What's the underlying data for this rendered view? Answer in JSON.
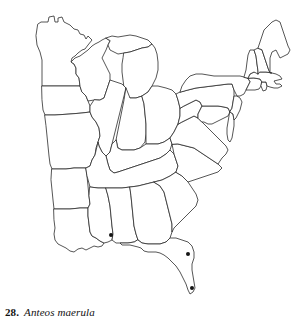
{
  "figure": {
    "kind": "species-distribution-map",
    "caption_number": "28.",
    "species_name": "Anteos maerula",
    "region_described": "Eastern United States",
    "outline_color": "#2b2b2b",
    "fill_color": "#ffffff",
    "dot_color": "#151515",
    "background_color": "#ffffff"
  },
  "map": {
    "title": "",
    "projection_note": "",
    "states": [
      {
        "id": "minnesota",
        "label": "Minnesota"
      },
      {
        "id": "iowa",
        "label": "Iowa"
      },
      {
        "id": "missouri",
        "label": "Missouri"
      },
      {
        "id": "arkansas",
        "label": "Arkansas"
      },
      {
        "id": "louisiana",
        "label": "Louisiana"
      },
      {
        "id": "wisconsin",
        "label": "Wisconsin"
      },
      {
        "id": "michigan",
        "label": "Michigan"
      },
      {
        "id": "illinois",
        "label": "Illinois"
      },
      {
        "id": "indiana",
        "label": "Indiana"
      },
      {
        "id": "ohio",
        "label": "Ohio"
      },
      {
        "id": "kentucky",
        "label": "Kentucky"
      },
      {
        "id": "tennessee",
        "label": "Tennessee"
      },
      {
        "id": "mississippi",
        "label": "Mississippi"
      },
      {
        "id": "alabama",
        "label": "Alabama"
      },
      {
        "id": "georgia",
        "label": "Georgia"
      },
      {
        "id": "florida",
        "label": "Florida"
      },
      {
        "id": "south-carolina",
        "label": "South Carolina"
      },
      {
        "id": "north-carolina",
        "label": "North Carolina"
      },
      {
        "id": "virginia",
        "label": "Virginia"
      },
      {
        "id": "west-virginia",
        "label": "West Virginia"
      },
      {
        "id": "maryland",
        "label": "Maryland"
      },
      {
        "id": "delaware",
        "label": "Delaware"
      },
      {
        "id": "pennsylvania",
        "label": "Pennsylvania"
      },
      {
        "id": "new-jersey",
        "label": "New Jersey"
      },
      {
        "id": "new-york",
        "label": "New York"
      },
      {
        "id": "connecticut",
        "label": "Connecticut"
      },
      {
        "id": "rhode-island",
        "label": "Rhode Island"
      },
      {
        "id": "massachusetts",
        "label": "Massachusetts"
      },
      {
        "id": "vermont",
        "label": "Vermont"
      },
      {
        "id": "new-hampshire",
        "label": "New Hampshire"
      },
      {
        "id": "maine",
        "label": "Maine"
      }
    ],
    "record_dots": [
      {
        "id": "record-coastal-mississippi",
        "state": "Mississippi",
        "x": 111,
        "y": 235,
        "r": 2.0
      },
      {
        "id": "record-central-florida",
        "state": "Florida",
        "x": 188,
        "y": 254,
        "r": 2.0
      },
      {
        "id": "record-south-florida",
        "state": "Florida",
        "x": 192,
        "y": 288,
        "r": 2.0
      }
    ],
    "record_count": 3
  }
}
